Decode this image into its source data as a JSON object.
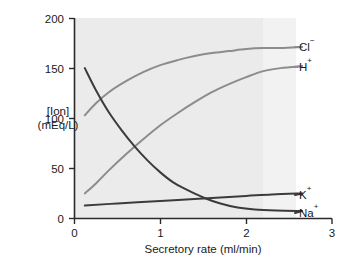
{
  "chart_data": {
    "type": "line",
    "title": "",
    "xlabel": "Secretory rate (ml/min)",
    "ylabel_line1": "[Ion]",
    "ylabel_line2": "(mEq/L)",
    "xlim": [
      0,
      3
    ],
    "ylim": [
      0,
      200
    ],
    "xticks": [
      "0",
      "1",
      "2",
      "3"
    ],
    "xtick_values": [
      0,
      1,
      2,
      3
    ],
    "yticks": [
      "0",
      "50",
      "100",
      "150",
      "200"
    ],
    "ytick_values": [
      0,
      50,
      100,
      150,
      200
    ],
    "grid": false,
    "legend_position": "right-inline-labels",
    "plot_background": "#ebebeb",
    "series": [
      {
        "name": "Cl⁻",
        "label": "Cl",
        "charge": "−",
        "color": "#8c8c8c",
        "x": [
          0.12,
          0.25,
          0.4,
          0.6,
          0.8,
          1.0,
          1.2,
          1.4,
          1.6,
          1.8,
          2.0,
          2.2,
          2.4,
          2.65
        ],
        "values": [
          103,
          115,
          126,
          137,
          146,
          153,
          158,
          162,
          165,
          167,
          169,
          170,
          170,
          171
        ],
        "label_y": 171
      },
      {
        "name": "H⁺",
        "label": "H",
        "charge": "+",
        "color": "#8c8c8c",
        "x": [
          0.12,
          0.25,
          0.4,
          0.6,
          0.8,
          1.0,
          1.2,
          1.4,
          1.6,
          1.8,
          2.0,
          2.2,
          2.4,
          2.65
        ],
        "values": [
          25,
          35,
          48,
          64,
          79,
          93,
          105,
          116,
          126,
          134,
          141,
          147,
          150,
          152
        ],
        "label_y": 152
      },
      {
        "name": "K⁺",
        "label": "K",
        "charge": "+",
        "color": "#3b3b3b",
        "x": [
          0.12,
          0.5,
          1.0,
          1.3,
          1.6,
          2.0,
          2.3,
          2.65
        ],
        "values": [
          13,
          15,
          17.5,
          19,
          20.5,
          22.5,
          24,
          25
        ],
        "label_y": 25
      },
      {
        "name": "Na⁺",
        "label": "Na",
        "charge": "+",
        "color": "#3b3b3b",
        "x": [
          0.12,
          0.25,
          0.4,
          0.55,
          0.7,
          0.85,
          1.0,
          1.15,
          1.3,
          1.5,
          1.7,
          1.9,
          2.1,
          2.35,
          2.65
        ],
        "values": [
          150,
          128,
          106,
          88,
          72,
          58,
          46,
          36,
          29,
          21,
          15,
          11,
          9,
          8,
          7.5
        ],
        "label_y": 7.5
      }
    ]
  },
  "axes": {
    "y_axis_name": "y-axis",
    "x_axis_name": "x-axis"
  }
}
